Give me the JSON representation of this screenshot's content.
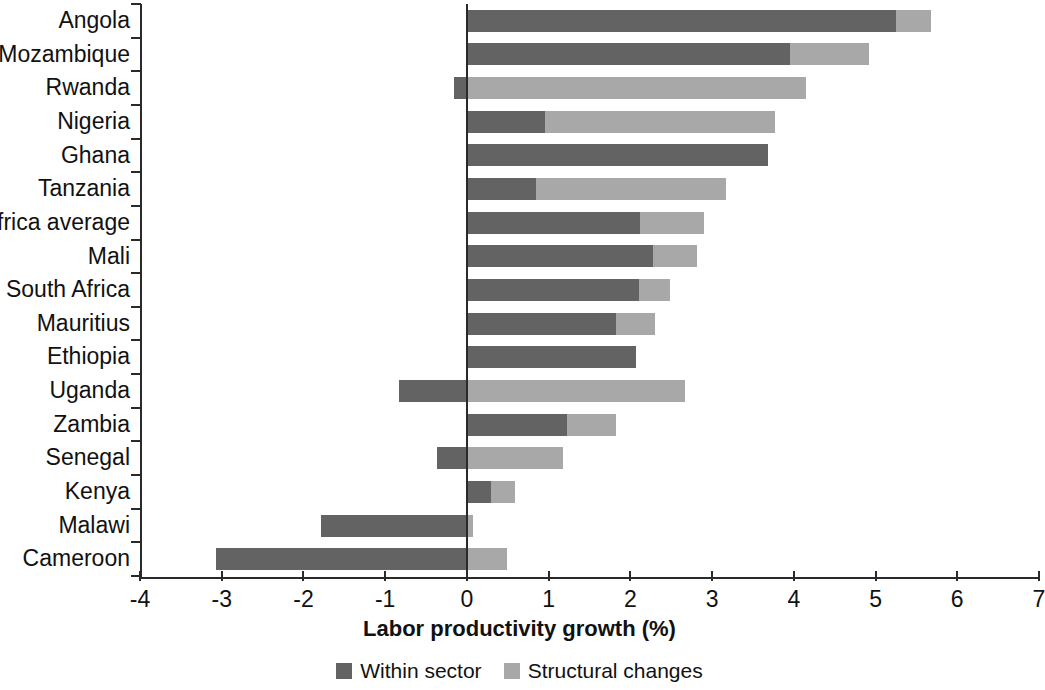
{
  "chart_data": {
    "type": "bar",
    "orientation": "horizontal",
    "stacked": true,
    "title": "",
    "xlabel": "Labor productivity growth (%)",
    "ylabel": "",
    "xlim": [
      -4,
      7
    ],
    "xticks": [
      -4,
      -3,
      -2,
      -1,
      0,
      1,
      2,
      3,
      4,
      5,
      6,
      7
    ],
    "xticklabels": [
      "-4",
      "-3",
      "-2",
      "-1",
      "0",
      "1",
      "2",
      "3",
      "4",
      "5",
      "6",
      "7"
    ],
    "grid": false,
    "legend_position": "bottom",
    "categories": [
      "Angola",
      "Mozambique",
      "Rwanda",
      "Nigeria",
      "Ghana",
      "Tanzania",
      "Africa average",
      "Mali",
      "South Africa",
      "Mauritius",
      "Ethiopia",
      "Uganda",
      "Zambia",
      "Senegal",
      "Kenya",
      "Malawi",
      "Cameroon"
    ],
    "series": [
      {
        "name": "Within sector",
        "color": "#636363",
        "values": [
          5.25,
          3.95,
          -0.16,
          0.95,
          3.68,
          0.85,
          2.12,
          2.28,
          2.1,
          1.82,
          2.07,
          -0.83,
          1.23,
          -0.37,
          0.3,
          -1.78,
          -3.07
        ]
      },
      {
        "name": "Structural changes",
        "color": "#a8a8a8",
        "values": [
          0.43,
          0.97,
          4.15,
          2.82,
          0.0,
          2.32,
          0.78,
          0.54,
          0.38,
          0.48,
          0.0,
          2.67,
          0.59,
          1.18,
          0.29,
          0.08,
          0.49
        ]
      }
    ],
    "totals": [
      5.68,
      4.92,
      3.99,
      3.77,
      3.68,
      3.17,
      2.9,
      2.82,
      2.48,
      2.3,
      2.07,
      1.84,
      1.82,
      0.81,
      0.59,
      -1.7,
      -2.58
    ]
  },
  "legend": {
    "items": [
      {
        "label": "Within sector",
        "color": "#636363"
      },
      {
        "label": "Structural changes",
        "color": "#a8a8a8"
      }
    ]
  }
}
